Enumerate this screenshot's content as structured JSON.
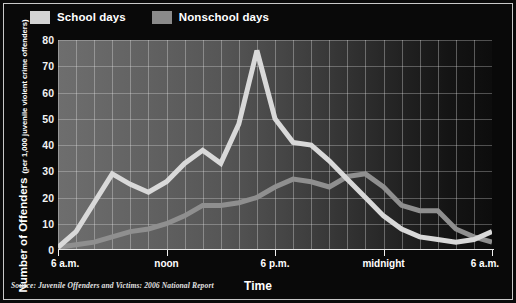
{
  "chart_data": {
    "type": "line",
    "title": "",
    "xlabel": "Time",
    "ylabel": "Number of Offenders",
    "ylabel_sub": "(per 1,000 juvenile violent crime offenders)",
    "ylim": [
      0,
      80
    ],
    "yticks": [
      0,
      10,
      20,
      30,
      40,
      50,
      60,
      70,
      80
    ],
    "xlim": [
      6,
      30
    ],
    "xtick_values": [
      6,
      12,
      18,
      24,
      30
    ],
    "xtick_labels": [
      "6 a.m.",
      "noon",
      "6 p.m.",
      "midnight",
      "6 a.m."
    ],
    "grid": true,
    "legend_position": "top-left",
    "x": [
      6,
      7,
      8,
      9,
      10,
      11,
      12,
      13,
      14,
      15,
      16,
      17,
      18,
      19,
      20,
      21,
      22,
      23,
      24,
      25,
      26,
      27,
      28,
      29,
      30
    ],
    "series": [
      {
        "name": "School days",
        "color": "#d9d9d9",
        "values": [
          1,
          7,
          18,
          29,
          25,
          22,
          26,
          33,
          38,
          33,
          48,
          76,
          50,
          41,
          40,
          34,
          27,
          20,
          13,
          8,
          5,
          4,
          3,
          4,
          7
        ]
      },
      {
        "name": "Nonschool days",
        "color": "#8f8f8f",
        "values": [
          1,
          2,
          3,
          5,
          7,
          8,
          10,
          13,
          17,
          17,
          18,
          20,
          24,
          27,
          26,
          24,
          28,
          29,
          24,
          17,
          15,
          15,
          8,
          5,
          3
        ]
      }
    ]
  },
  "legend": {
    "items": [
      {
        "label": "School days",
        "swatch": "school"
      },
      {
        "label": "Nonschool days",
        "swatch": "nonschool"
      }
    ]
  },
  "axes": {
    "y_title_main": "Number of Offenders",
    "y_title_sub": "(per 1,000 juvenile violent crime offenders)",
    "x_title": "Time"
  },
  "footer": {
    "source": "Source: Juvenile Offenders and Victims: 2006 National Report"
  },
  "colors": {
    "panel_background": "#090909",
    "school_days": "#d9d9d9",
    "nonschool_days": "#8f8f8f",
    "text": "#ffffff",
    "grid": "#ebebeb"
  }
}
